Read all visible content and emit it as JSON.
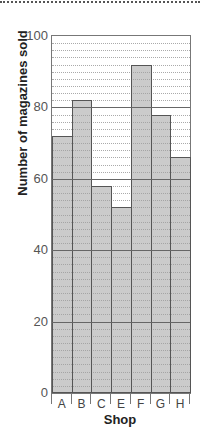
{
  "chart_data": {
    "type": "bar",
    "title": "",
    "xlabel": "Shop",
    "ylabel": "Number of magazines sold",
    "categories": [
      "A",
      "B",
      "C",
      "E",
      "F",
      "G",
      "H"
    ],
    "values": [
      72,
      82,
      58,
      52,
      92,
      78,
      66
    ],
    "ylim": [
      0,
      100
    ],
    "yticks": [
      "0",
      "20",
      "40",
      "60",
      "80",
      "100"
    ],
    "grid": {
      "major_step": 20,
      "minor_step": 2
    },
    "legend": null
  },
  "colors": {
    "bar_fill": "#c6c6c6",
    "bar_border": "#555555",
    "major_grid": "#666666",
    "minor_grid": "#aaaaaa"
  }
}
